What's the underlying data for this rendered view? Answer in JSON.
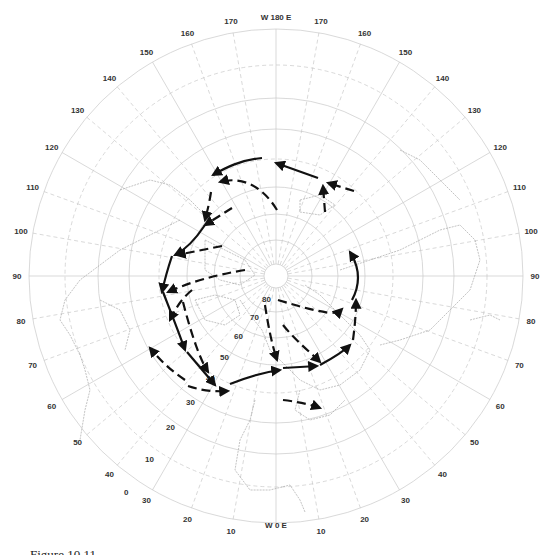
{
  "figure": {
    "type": "polar-stereographic-map",
    "hemisphere": "northern",
    "caption_visible": "Figure 10.11 ...",
    "caption_truncated": true
  },
  "longitude_labels": {
    "top": "W 180 E",
    "bottom": "W 0 E",
    "left_side": [
      "170",
      "160",
      "150",
      "140",
      "130",
      "120",
      "110",
      "100",
      "90",
      "80",
      "70",
      "60",
      "50",
      "40",
      "30",
      "20",
      "10"
    ],
    "right_side": [
      "170",
      "160",
      "150",
      "140",
      "130",
      "120",
      "110",
      "100",
      "90",
      "80",
      "70",
      "60",
      "50",
      "40",
      "30",
      "20",
      "10"
    ]
  },
  "latitude_labels": [
    "80",
    "70",
    "60",
    "50",
    "40",
    "30",
    "20",
    "10",
    "0"
  ],
  "arrows": {
    "style_legend": [
      "solid",
      "dashed"
    ],
    "count": 22
  },
  "colors": {
    "grid": "#c8c8c8",
    "coastline": "#9a9a9a",
    "arrow": "#111111",
    "label": "#333333",
    "background": "#ffffff"
  }
}
